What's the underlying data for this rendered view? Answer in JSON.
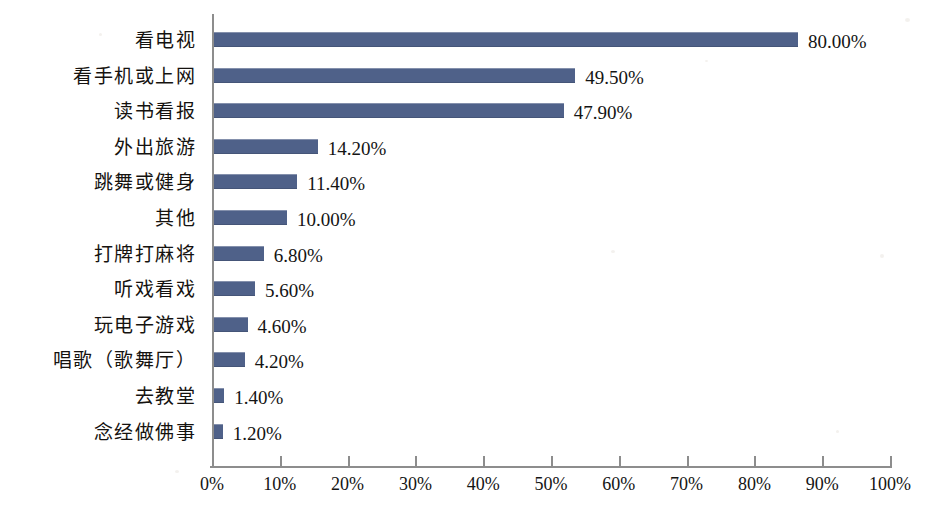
{
  "chart_data": {
    "type": "bar",
    "orientation": "horizontal",
    "title": "",
    "subtitle": "",
    "xlabel": "",
    "ylabel": "",
    "xlim": [
      0,
      100
    ],
    "grid": false,
    "legend": null,
    "bar_color": "#4f6189",
    "axis_color": "#8d8d8d",
    "text_color": "#141414",
    "background": "#ffffff",
    "x_tick_labels": [
      "0%",
      "10%",
      "20%",
      "30%",
      "40%",
      "50%",
      "60%",
      "70%",
      "80%",
      "90%",
      "100%"
    ],
    "x_tick_values": [
      0,
      10,
      20,
      30,
      40,
      50,
      60,
      70,
      80,
      90,
      100
    ],
    "categories": [
      "看电视",
      "看手机或上网",
      "读书看报",
      "外出旅游",
      "跳舞或健身",
      "其他",
      "打牌打麻将",
      "听戏看戏",
      "玩电子游戏",
      "唱歌（歌舞厅）",
      "去教堂",
      "念经做佛事"
    ],
    "values": [
      80.0,
      49.5,
      47.9,
      14.2,
      11.4,
      10.0,
      6.8,
      5.6,
      4.6,
      4.2,
      1.4,
      1.2
    ],
    "value_labels": [
      "80.00%",
      "49.50%",
      "47.90%",
      "14.20%",
      "11.40%",
      "10.00%",
      "6.80%",
      "5.60%",
      "4.60%",
      "4.20%",
      "1.40%",
      "1.20%"
    ]
  }
}
